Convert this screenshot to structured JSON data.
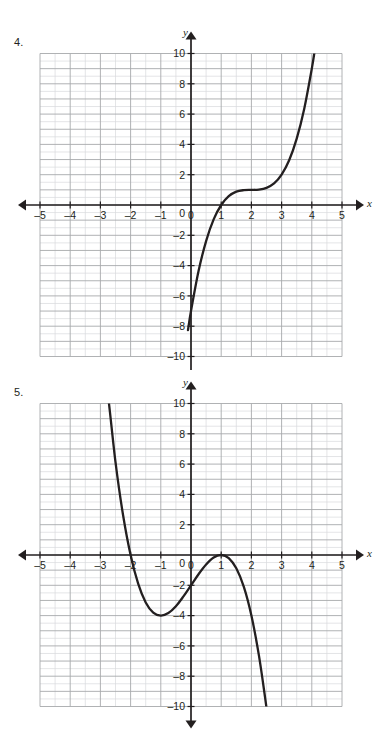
{
  "page": {
    "width": 383,
    "height": 731,
    "background": "#ffffff",
    "ink": "#231f20",
    "grid_minor_color": "#d9dadc",
    "grid_major_color": "#a7a9ac",
    "curve_color": "#231f20"
  },
  "problems": [
    {
      "number_label": "4.",
      "axis_labels": {
        "x": "x",
        "y": "y"
      },
      "chart_data": {
        "type": "line",
        "title": "",
        "subtitle": "",
        "xlabel": "x",
        "ylabel": "y",
        "xlim": [
          -5,
          5
        ],
        "ylim": [
          -10,
          10
        ],
        "xticks": [
          -5,
          -4,
          -3,
          -2,
          -1,
          0,
          1,
          2,
          3,
          4,
          5
        ],
        "xtick_labels": [
          "-5",
          "-4",
          "-3",
          "-2",
          "-1",
          "0",
          "1",
          "2",
          "3",
          "4",
          "5"
        ],
        "yticks": [
          -10,
          -8,
          -6,
          -4,
          -2,
          0,
          2,
          4,
          6,
          8,
          10
        ],
        "ytick_labels": [
          "-10",
          "-8",
          "-6",
          "-4",
          "-2",
          "0",
          "2",
          "4",
          "6",
          "8",
          "10"
        ],
        "grid": true,
        "grid_minor_x_per_unit": 2,
        "grid_minor_y_per_unit": 2,
        "legend": "none",
        "annotations": [],
        "series": [
          {
            "name": "cubic",
            "expression": "y = (x - 2)^3 + 1",
            "points": [
              {
                "x": -0.1,
                "y": -8.26
              },
              {
                "x": 0.0,
                "y": -7.0
              },
              {
                "x": 0.25,
                "y": -4.36
              },
              {
                "x": 0.5,
                "y": -2.38
              },
              {
                "x": 0.75,
                "y": -0.95
              },
              {
                "x": 1.0,
                "y": 0.0
              },
              {
                "x": 1.25,
                "y": 0.58
              },
              {
                "x": 1.5,
                "y": 0.88
              },
              {
                "x": 1.75,
                "y": 0.98
              },
              {
                "x": 2.0,
                "y": 1.0
              },
              {
                "x": 2.25,
                "y": 1.02
              },
              {
                "x": 2.5,
                "y": 1.13
              },
              {
                "x": 2.75,
                "y": 1.42
              },
              {
                "x": 3.0,
                "y": 2.0
              },
              {
                "x": 3.25,
                "y": 2.95
              },
              {
                "x": 3.5,
                "y": 4.38
              },
              {
                "x": 3.75,
                "y": 6.36
              },
              {
                "x": 4.0,
                "y": 9.0
              },
              {
                "x": 4.12,
                "y": 10.5
              }
            ]
          }
        ]
      }
    },
    {
      "number_label": "5.",
      "axis_labels": {
        "x": "x",
        "y": "y"
      },
      "chart_data": {
        "type": "line",
        "title": "",
        "subtitle": "",
        "xlabel": "x",
        "ylabel": "y",
        "xlim": [
          -5,
          5
        ],
        "ylim": [
          -10,
          10
        ],
        "xticks": [
          -5,
          -4,
          -3,
          -2,
          -1,
          0,
          1,
          2,
          3,
          4,
          5
        ],
        "xtick_labels": [
          "-5",
          "-4",
          "-3",
          "-2",
          "-1",
          "0",
          "1",
          "2",
          "3",
          "4",
          "5"
        ],
        "yticks": [
          -10,
          -8,
          -6,
          -4,
          -2,
          0,
          2,
          4,
          6,
          8,
          10
        ],
        "ytick_labels": [
          "-10",
          "-8",
          "-6",
          "-4",
          "-2",
          "0",
          "2",
          "4",
          "6",
          "8",
          "10"
        ],
        "grid": true,
        "grid_minor_x_per_unit": 2,
        "grid_minor_y_per_unit": 2,
        "legend": "none",
        "annotations": [],
        "series": [
          {
            "name": "cubic",
            "expression": "y = -(x + 2)(x - 1)^2",
            "points": [
              {
                "x": -2.85,
                "y": 11.1
              },
              {
                "x": -2.75,
                "y": 10.55
              },
              {
                "x": -2.5,
                "y": 6.13
              },
              {
                "x": -2.25,
                "y": 2.64
              },
              {
                "x": -2.0,
                "y": 0.0
              },
              {
                "x": -1.75,
                "y": -1.89
              },
              {
                "x": -1.5,
                "y": -3.13
              },
              {
                "x": -1.25,
                "y": -3.8
              },
              {
                "x": -1.0,
                "y": -4.0
              },
              {
                "x": -0.75,
                "y": -3.83
              },
              {
                "x": -0.5,
                "y": -3.38
              },
              {
                "x": -0.25,
                "y": -2.73
              },
              {
                "x": 0.0,
                "y": -2.0
              },
              {
                "x": 0.25,
                "y": -1.27
              },
              {
                "x": 0.5,
                "y": -0.63
              },
              {
                "x": 0.75,
                "y": -0.17
              },
              {
                "x": 1.0,
                "y": 0.0
              },
              {
                "x": 1.25,
                "y": -0.2
              },
              {
                "x": 1.5,
                "y": -0.88
              },
              {
                "x": 1.75,
                "y": -2.11
              },
              {
                "x": 2.0,
                "y": -4.0
              },
              {
                "x": 2.25,
                "y": -6.64
              },
              {
                "x": 2.45,
                "y": -9.36
              },
              {
                "x": 2.52,
                "y": -10.4
              }
            ]
          }
        ]
      }
    }
  ]
}
